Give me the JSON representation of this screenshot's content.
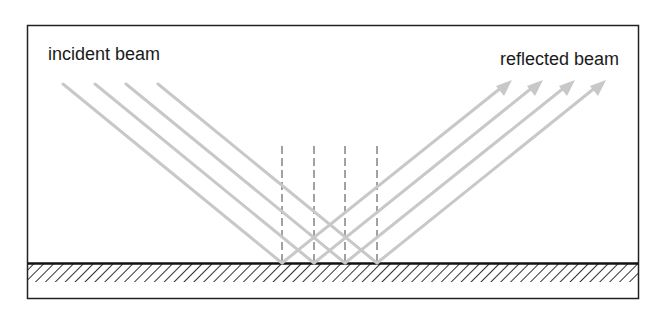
{
  "diagram": {
    "type": "specular reflection",
    "labels": {
      "incident": "incident beam",
      "reflected": "reflected beam"
    },
    "colors": {
      "beam": "#c8c8c8",
      "frame": "#222222",
      "surface": "#111111",
      "hatch": "#333333",
      "normal": "#444444"
    },
    "beam_count": 4,
    "incident_beams": [
      {
        "x1": 63,
        "y1": 84,
        "x2": 282,
        "y2": 263
      },
      {
        "x1": 95,
        "y1": 84,
        "x2": 314,
        "y2": 263
      },
      {
        "x1": 126,
        "y1": 84,
        "x2": 345,
        "y2": 263
      },
      {
        "x1": 158,
        "y1": 84,
        "x2": 377,
        "y2": 263
      }
    ],
    "reflected_beams": [
      {
        "x1": 282,
        "y1": 263,
        "x2": 510,
        "y2": 81
      },
      {
        "x1": 314,
        "y1": 263,
        "x2": 541,
        "y2": 81
      },
      {
        "x1": 345,
        "y1": 263,
        "x2": 573,
        "y2": 81
      },
      {
        "x1": 377,
        "y1": 263,
        "x2": 604,
        "y2": 81
      }
    ],
    "normals_x": [
      282,
      314,
      345,
      377
    ]
  }
}
